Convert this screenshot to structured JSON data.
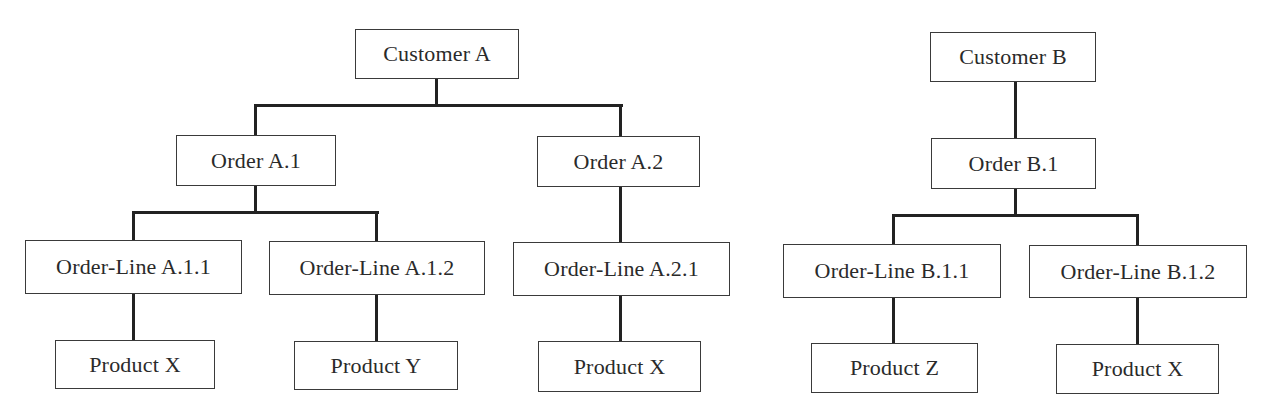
{
  "diagram": {
    "title": "",
    "line_color": "#222222",
    "border_color": "#3a3a3a",
    "trees": [
      {
        "name": "Customer A hierarchy",
        "customer": {
          "label": "Customer A"
        },
        "orders": [
          {
            "label": "Order A.1",
            "order_lines": [
              {
                "label": "Order-Line A.1.1",
                "product": "Product X"
              },
              {
                "label": "Order-Line A.1.2",
                "product": "Product Y"
              }
            ]
          },
          {
            "label": "Order A.2",
            "order_lines": [
              {
                "label": "Order-Line A.2.1",
                "product": "Product X"
              }
            ]
          }
        ]
      },
      {
        "name": "Customer B hierarchy",
        "customer": {
          "label": "Customer B"
        },
        "orders": [
          {
            "label": "Order B.1",
            "order_lines": [
              {
                "label": "Order-Line B.1.1",
                "product": "Product Z"
              },
              {
                "label": "Order-Line B.1.2",
                "product": "Product X"
              }
            ]
          }
        ]
      }
    ]
  }
}
